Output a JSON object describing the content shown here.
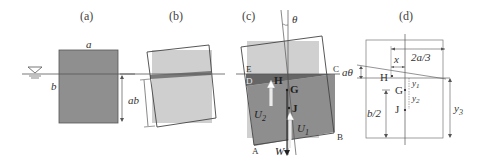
{
  "panels": {
    "a": {
      "label": "(a)",
      "width_label": "a",
      "height_label": "b"
    },
    "b": {
      "label": "(b)",
      "depth_label": "ab"
    },
    "c": {
      "label": "(c)",
      "angle_label": "θ",
      "points": {
        "E": "E",
        "C": "C",
        "D": "D",
        "A": "A",
        "B": "B"
      },
      "centers": {
        "H": "H",
        "G": "G",
        "J": "J"
      },
      "forces": {
        "U2": "U",
        "U2_sub": "2",
        "U1": "U",
        "U1_sub": "1",
        "W": "W"
      }
    },
    "d": {
      "label": "(d)",
      "dim_2a3": "2a/3",
      "dim_x": "x",
      "dim_atheta": "aθ",
      "points": {
        "H": "H",
        "G": "G",
        "J": "J"
      },
      "dim_y1": "y",
      "dim_y1_sub": "1",
      "dim_y2": "y",
      "dim_y2_sub": "2",
      "dim_y3": "y",
      "dim_y3_sub": "3",
      "dim_b2": "b/2"
    }
  },
  "colors": {
    "dark_gray": "#8a8a8a",
    "mid_gray": "#a3a3a3",
    "light_gray": "#cfcfcf",
    "darker_band": "#6e6e6e",
    "line": "#444444"
  }
}
